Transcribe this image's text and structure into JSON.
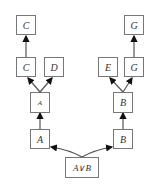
{
  "diagram": {
    "nodes": [
      {
        "id": "c_top",
        "label": "C"
      },
      {
        "id": "c_mid",
        "label": "C"
      },
      {
        "id": "d_mid",
        "label": "D"
      },
      {
        "id": "a_small",
        "label": "A"
      },
      {
        "id": "a_low",
        "label": "A"
      },
      {
        "id": "g_top",
        "label": "G"
      },
      {
        "id": "e_mid",
        "label": "E"
      },
      {
        "id": "g_mid",
        "label": "G"
      },
      {
        "id": "b_small",
        "label": "B"
      },
      {
        "id": "b_low",
        "label": "B"
      },
      {
        "id": "a_or_b",
        "label": "A∨B"
      }
    ],
    "edges": [
      {
        "from": "c_mid",
        "to": "c_top"
      },
      {
        "from": "a_small",
        "to": "c_mid"
      },
      {
        "from": "a_small",
        "to": "d_mid"
      },
      {
        "from": "a_low",
        "to": "a_small"
      },
      {
        "from": "a_or_b",
        "to": "a_low"
      },
      {
        "from": "g_mid",
        "to": "g_top"
      },
      {
        "from": "b_small",
        "to": "e_mid"
      },
      {
        "from": "b_small",
        "to": "g_mid"
      },
      {
        "from": "b_low",
        "to": "b_small"
      },
      {
        "from": "a_or_b",
        "to": "b_low"
      }
    ]
  }
}
